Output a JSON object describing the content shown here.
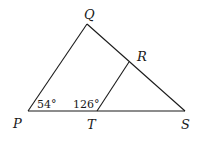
{
  "diagram": {
    "type": "triangle-with-interior-segment",
    "points": {
      "P": {
        "label": "P",
        "x": 28,
        "y": 111
      },
      "Q": {
        "label": "Q",
        "x": 87,
        "y": 24
      },
      "S": {
        "label": "S",
        "x": 185,
        "y": 111
      },
      "T": {
        "label": "T",
        "x": 97,
        "y": 111
      },
      "R": {
        "label": "R",
        "x": 129,
        "y": 62
      }
    },
    "segments": [
      {
        "from": "P",
        "to": "Q"
      },
      {
        "from": "Q",
        "to": "S"
      },
      {
        "from": "P",
        "to": "S"
      },
      {
        "from": "T",
        "to": "R"
      }
    ],
    "angles": [
      {
        "vertex": "P",
        "label": "54°"
      },
      {
        "vertex": "T",
        "label": "126°"
      }
    ]
  }
}
